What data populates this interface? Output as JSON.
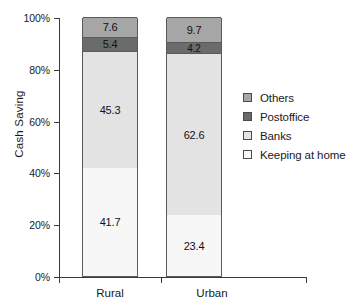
{
  "chart_data": {
    "type": "bar",
    "title": "",
    "subtitle": "",
    "xlabel": "",
    "ylabel": "Cash Saving",
    "categories": [
      "Rural",
      "Urban"
    ],
    "stacked": true,
    "stack_mode": "percent",
    "ylim": [
      0,
      100
    ],
    "ytick_labels": [
      "0%",
      "20%",
      "40%",
      "60%",
      "80%",
      "100%"
    ],
    "ytick_values": [
      0,
      20,
      40,
      60,
      80,
      100
    ],
    "grid": false,
    "legend_position": "right",
    "series": [
      {
        "name": "Others",
        "color": "#a6a6a6",
        "values": [
          7.6,
          9.7
        ]
      },
      {
        "name": "Postoffice",
        "color": "#6b6b6b",
        "values": [
          5.4,
          4.2
        ]
      },
      {
        "name": "Banks",
        "color": "#e3e3e3",
        "values": [
          45.3,
          62.6
        ]
      },
      {
        "name": "Keeping at home",
        "color": "#f7f7f7",
        "values": [
          41.7,
          23.4
        ]
      }
    ],
    "stack_order_bottom_to_top": [
      "Keeping at home",
      "Banks",
      "Postoffice",
      "Others"
    ],
    "data_labels": {
      "Rural": {
        "Keeping at home": "41.7",
        "Banks": "45.3",
        "Postoffice": "5.4",
        "Others": "7.6"
      },
      "Urban": {
        "Keeping at home": "23.4",
        "Banks": "62.6",
        "Postoffice": "4.2",
        "Others": "9.7"
      }
    }
  },
  "legend": {
    "items": [
      {
        "label": "Others",
        "color": "#a6a6a6"
      },
      {
        "label": "Postoffice",
        "color": "#6b6b6b"
      },
      {
        "label": "Banks",
        "color": "#e3e3e3"
      },
      {
        "label": "Keeping at home",
        "color": "#f9f9f9"
      }
    ]
  },
  "axis": {
    "y_title": "Cash Saving",
    "y_ticks": [
      "100%",
      "80%",
      "60%",
      "40%",
      "20%",
      "0%"
    ],
    "x_ticks": [
      "Rural",
      "Urban"
    ]
  },
  "colors": {
    "axis": "#3a3a3a",
    "bar_outline": "#5a5a5a",
    "text": "#1a1a1a"
  }
}
